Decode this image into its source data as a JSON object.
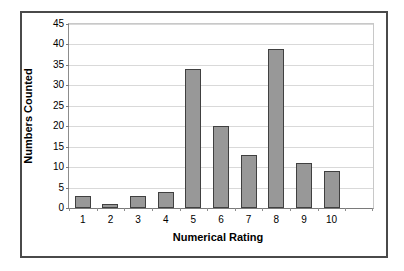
{
  "chart_data": {
    "type": "bar",
    "title": "",
    "xlabel": "Numerical Rating",
    "ylabel": "Numbers Counted",
    "categories": [
      "1",
      "2",
      "3",
      "4",
      "5",
      "6",
      "7",
      "8",
      "9",
      "10"
    ],
    "values": [
      3,
      1,
      3,
      4,
      34,
      20,
      13,
      39,
      11,
      9
    ],
    "ylim": [
      0,
      45
    ],
    "ytick_step": 5,
    "yticks": [
      0,
      5,
      10,
      15,
      20,
      25,
      30,
      35,
      40,
      45
    ],
    "ytick_labels": [
      "0",
      "5",
      "10",
      "15",
      "20",
      "25",
      "30",
      "35",
      "40",
      "45"
    ],
    "grid": "horizontal",
    "legend": "none",
    "bar_color": "#989898",
    "bar_border_color": "#404040",
    "gridline_color": "#d9d9d9",
    "frame_color": "#4a4a4a",
    "background": "#ffffff"
  }
}
